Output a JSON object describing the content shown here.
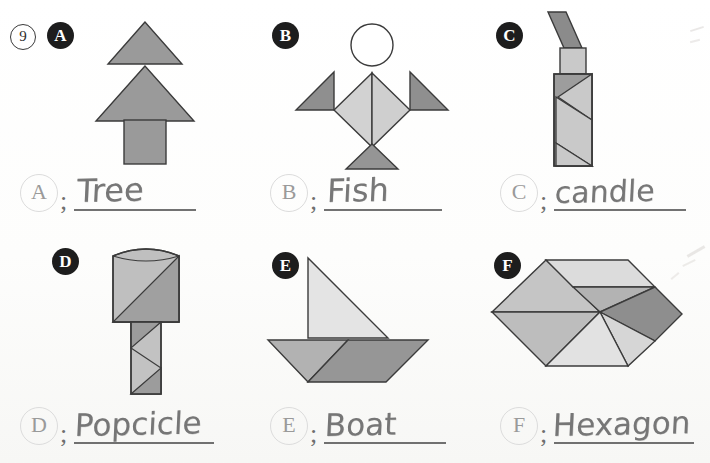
{
  "worksheet": {
    "question_number": "9",
    "title_visible": false
  },
  "problems": [
    {
      "badge": "A",
      "answer_letter": "A",
      "separator": ";",
      "answer_text": "Tree",
      "figure_name": "tangram-tree",
      "pieces": [
        {
          "name": "small-triangle-top",
          "color": "#9a9a9a"
        },
        {
          "name": "large-triangle-middle",
          "color": "#9a9a9a"
        },
        {
          "name": "square-trunk",
          "color": "#9a9a9a"
        }
      ]
    },
    {
      "badge": "B",
      "answer_letter": "B",
      "separator": ";",
      "answer_text": "Fish",
      "figure_name": "tangram-fish",
      "pieces": [
        {
          "name": "circle-head",
          "color": "#ffffff"
        },
        {
          "name": "body-left-triangle",
          "color": "#d2d2d2"
        },
        {
          "name": "body-right-triangle",
          "color": "#cfcfcf"
        },
        {
          "name": "left-fin-triangle",
          "color": "#8f8f8f"
        },
        {
          "name": "right-fin-triangle",
          "color": "#8f8f8f"
        },
        {
          "name": "tail-triangle",
          "color": "#959595"
        }
      ]
    },
    {
      "badge": "C",
      "answer_letter": "C",
      "separator": ";",
      "answer_text": "candle",
      "figure_name": "tangram-candle",
      "pieces": [
        {
          "name": "flame-parallelogram",
          "color": "#8b8b8b"
        },
        {
          "name": "wick-square",
          "color": "#c9c9c9"
        },
        {
          "name": "body-triangle-dark-1",
          "color": "#9d9d9d"
        },
        {
          "name": "body-triangle-light-1",
          "color": "#c9c9c9"
        },
        {
          "name": "body-triangle-dark-2",
          "color": "#9d9d9d"
        },
        {
          "name": "body-triangle-light-2",
          "color": "#c9c9c9"
        }
      ]
    },
    {
      "badge": "D",
      "answer_letter": "D",
      "separator": ";",
      "answer_text": "Popcicle",
      "figure_name": "tangram-popsicle",
      "pieces": [
        {
          "name": "head-light-half",
          "color": "#bfbfbf"
        },
        {
          "name": "head-dark-half",
          "color": "#a0a0a0"
        },
        {
          "name": "stick-light-half",
          "color": "#c2c2c2"
        },
        {
          "name": "stick-dark-half",
          "color": "#9c9c9c"
        }
      ]
    },
    {
      "badge": "E",
      "answer_letter": "E",
      "separator": ";",
      "answer_text": "Boat",
      "figure_name": "tangram-boat",
      "pieces": [
        {
          "name": "sail-triangle",
          "color": "#e4e4e4"
        },
        {
          "name": "hull-left-triangle",
          "color": "#b2b2b2"
        },
        {
          "name": "hull-right-parallelogram",
          "color": "#969696"
        }
      ]
    },
    {
      "badge": "F",
      "answer_letter": "F",
      "separator": ";",
      "answer_text": "Hexagon",
      "figure_name": "tangram-hexagon",
      "pieces": [
        {
          "name": "large-left-triangle",
          "color": "#bdbdbd"
        },
        {
          "name": "upper-left-triangle",
          "color": "#c5c5c5"
        },
        {
          "name": "top-parallelogram",
          "color": "#dcdcdc"
        },
        {
          "name": "mid-triangle",
          "color": "#b3b3b3"
        },
        {
          "name": "dark-right-square",
          "color": "#8e8e8e"
        },
        {
          "name": "lower-right-triangle",
          "color": "#d6d6d6"
        },
        {
          "name": "bottom-triangle",
          "color": "#e2e2e2"
        }
      ]
    }
  ]
}
